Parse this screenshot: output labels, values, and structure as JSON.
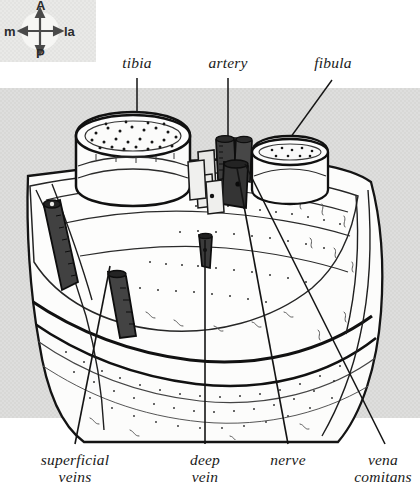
{
  "figure": {
    "background_color": "#ffffff",
    "panel_color": "#dededd",
    "ink_color": "#111111",
    "vessel_dark_color": "#3a3a3a",
    "bone_fill_color": "#fbfbfb"
  },
  "compass": {
    "name": "orientation-compass",
    "anterior": "A",
    "posterior": "P",
    "medial": "m",
    "lateral": "la",
    "disc_color": "#f2f2f0",
    "arrow_color": "#4a4a4a"
  },
  "labels": {
    "top": [
      {
        "id": "tibia",
        "text": "tibia",
        "x": 137,
        "y": 62
      },
      {
        "id": "artery",
        "text": "artery",
        "x": 228,
        "y": 62
      },
      {
        "id": "fibula",
        "text": "fibula",
        "x": 333,
        "y": 62
      }
    ],
    "bottom": [
      {
        "id": "superficial-veins",
        "lines": [
          "superficial",
          "veins"
        ],
        "x": 75,
        "y": 458
      },
      {
        "id": "deep-vein",
        "lines": [
          "deep",
          "vein"
        ],
        "x": 205,
        "y": 458
      },
      {
        "id": "nerve",
        "lines": [
          "nerve"
        ],
        "x": 288,
        "y": 458
      },
      {
        "id": "vena-comitans",
        "lines": [
          "vena",
          "comitans"
        ],
        "x": 383,
        "y": 458
      }
    ]
  },
  "leaders": {
    "tibia": {
      "from": [
        137,
        76
      ],
      "to": [
        137,
        140
      ],
      "dot": true
    },
    "artery": {
      "from": [
        228,
        76
      ],
      "to": [
        228,
        148
      ],
      "dot": false
    },
    "fibula": {
      "from": [
        330,
        78
      ],
      "to": [
        279,
        152
      ],
      "dot": true
    },
    "superficial_veins": {
      "from": [
        75,
        444
      ],
      "to": [
        110,
        268
      ]
    },
    "deep_vein": {
      "from": [
        205,
        444
      ],
      "to": [
        205,
        243
      ]
    },
    "nerve": {
      "from": [
        288,
        444
      ],
      "to": [
        236,
        168
      ]
    },
    "vena_comitans": {
      "from": [
        385,
        444
      ],
      "to": [
        244,
        166
      ]
    }
  },
  "structures": [
    {
      "name": "tibia-bone",
      "kind": "bone",
      "note": "large rounded cut bone, left of centre, stippled marrow"
    },
    {
      "name": "fibula-bone",
      "kind": "bone",
      "note": "smaller cut bone, right of centre"
    },
    {
      "name": "artery-stump",
      "kind": "vessel",
      "note": "dark cylindrical vessel in neurovascular bundle"
    },
    {
      "name": "vena-comitans",
      "kind": "vessel",
      "note": "paired dark vein beside artery"
    },
    {
      "name": "nerve-bundle",
      "kind": "nerve",
      "note": "pale bundle within neurovascular group"
    },
    {
      "name": "deep-vein-stump",
      "kind": "vessel",
      "note": "small dark vein in mid muscle mass"
    },
    {
      "name": "superficial-vein-1",
      "kind": "vessel",
      "note": "long dark oblique vein, upper left"
    },
    {
      "name": "superficial-vein-2",
      "kind": "vessel",
      "note": "shorter dark oblique vein, lower left"
    },
    {
      "name": "deep-fascia",
      "kind": "fascia",
      "note": "curved fascial bands across lower limb"
    }
  ]
}
